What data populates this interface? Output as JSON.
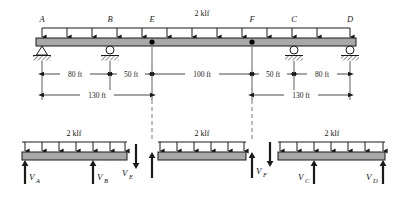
{
  "figure": {
    "load_label": "2 klf",
    "units": "ft",
    "colors": {
      "beam_fill": "#a8a8a8",
      "beam_stroke": "#1a1a1a",
      "line": "#1a1a1a",
      "dash": "#555555",
      "background": "#ffffff"
    }
  },
  "main_beam": {
    "load_label": "2 klf",
    "point_labels": [
      "A",
      "B",
      "E",
      "F",
      "C",
      "D"
    ],
    "points": [
      {
        "label": "A",
        "x_ft": 0,
        "support": "pin"
      },
      {
        "label": "B",
        "x_ft": 80,
        "support": "roller"
      },
      {
        "label": "E",
        "x_ft": 130,
        "support": "hinge"
      },
      {
        "label": "F",
        "x_ft": 230,
        "support": "hinge"
      },
      {
        "label": "C",
        "x_ft": 280,
        "support": "roller"
      },
      {
        "label": "D",
        "x_ft": 360,
        "support": "roller"
      }
    ],
    "load_arrow_count": 13,
    "dimensions": [
      {
        "label": "80 ft",
        "from": "A",
        "to": "B",
        "value_ft": 80
      },
      {
        "label": "50 ft",
        "from": "B",
        "to": "E",
        "value_ft": 50
      },
      {
        "label": "100 ft",
        "from": "E",
        "to": "F",
        "value_ft": 100
      },
      {
        "label": "50 ft",
        "from": "F",
        "to": "C",
        "value_ft": 50
      },
      {
        "label": "80 ft",
        "from": "C",
        "to": "D",
        "value_ft": 80
      }
    ],
    "overall_dimensions": [
      {
        "label": "130 ft",
        "from": "A",
        "to": "E",
        "value_ft": 130
      },
      {
        "label": "130 ft",
        "from": "F",
        "to": "D",
        "value_ft": 130
      }
    ]
  },
  "free_body_diagrams": [
    {
      "id": "fbd-ae",
      "load_label": "2 klf",
      "arrow_count": 7,
      "reactions": [
        {
          "label": "V",
          "sub": "A",
          "direction": "up",
          "position": "left"
        },
        {
          "label": "V",
          "sub": "B",
          "direction": "up",
          "position": "mid"
        }
      ],
      "end_force": {
        "label": "V",
        "sub": "E",
        "direction": "down",
        "position": "right"
      }
    },
    {
      "id": "fbd-ef",
      "load_label": "2 klf",
      "arrow_count": 6,
      "reactions": [
        {
          "label": "V",
          "sub": "E",
          "direction": "up",
          "position": "left"
        },
        {
          "label": "V",
          "sub": "F",
          "direction": "up",
          "position": "right"
        }
      ]
    },
    {
      "id": "fbd-fd",
      "load_label": "2 klf",
      "arrow_count": 7,
      "start_force": {
        "label": "V",
        "sub": "F",
        "direction": "down",
        "position": "left"
      },
      "reactions": [
        {
          "label": "V",
          "sub": "C",
          "direction": "up",
          "position": "mid"
        },
        {
          "label": "V",
          "sub": "D",
          "direction": "up",
          "position": "right"
        }
      ]
    }
  ]
}
